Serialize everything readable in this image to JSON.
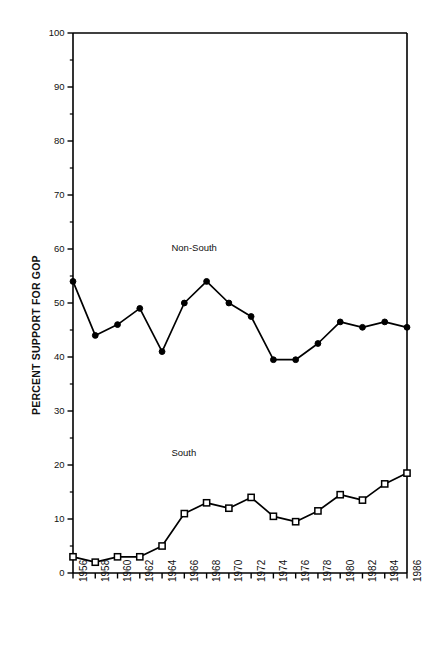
{
  "chart_data": {
    "type": "line",
    "title": "",
    "subtitle": "",
    "xlabel": "",
    "ylabel": "PERCENT SUPPORT FOR GOP",
    "categories": [
      "1956",
      "1958",
      "1960",
      "1962",
      "1964",
      "1966",
      "1968",
      "1970",
      "1972",
      "1974",
      "1976",
      "1978",
      "1980",
      "1982",
      "1984",
      "1986"
    ],
    "x": [
      1956,
      1958,
      1960,
      1962,
      1964,
      1966,
      1968,
      1970,
      1972,
      1974,
      1976,
      1978,
      1980,
      1982,
      1984,
      1986
    ],
    "xlim": [
      1956,
      1986
    ],
    "ylim": [
      0,
      100
    ],
    "y_ticks_major": [
      0,
      10,
      20,
      30,
      40,
      50,
      60,
      70,
      80,
      90,
      100
    ],
    "y_tick_labels": [
      "0",
      "10",
      "20",
      "30",
      "40",
      "50",
      "60",
      "70",
      "80",
      "90",
      "100"
    ],
    "y_ticks_minor": [
      5,
      15,
      25,
      35,
      45,
      55,
      65,
      75,
      85,
      95
    ],
    "grid": false,
    "legend_position": "inline-annotation",
    "series": [
      {
        "name": "Non-South",
        "marker": "filled-circle",
        "color": "#000000",
        "values": [
          54.0,
          44.0,
          46.0,
          49.0,
          41.0,
          50.0,
          54.0,
          50.0,
          47.5,
          39.5,
          39.5,
          42.5,
          46.5,
          45.5,
          46.5,
          45.5
        ]
      },
      {
        "name": "South",
        "marker": "open-square",
        "color": "#000000",
        "values": [
          3.0,
          2.0,
          3.0,
          3.0,
          5.0,
          11.0,
          13.0,
          12.0,
          14.0,
          10.5,
          9.5,
          11.5,
          14.5,
          13.5,
          16.5,
          18.5
        ]
      }
    ],
    "annotations": [
      {
        "text": "Non-South",
        "x_value": 1967,
        "y_value": 60
      },
      {
        "text": "South",
        "x_value": 1967,
        "y_value": 22
      }
    ]
  },
  "plot": {
    "frame_color": "#000000",
    "background": "#ffffff",
    "left_px": 73,
    "right_px": 407,
    "top_px": 33,
    "bottom_px": 573
  }
}
